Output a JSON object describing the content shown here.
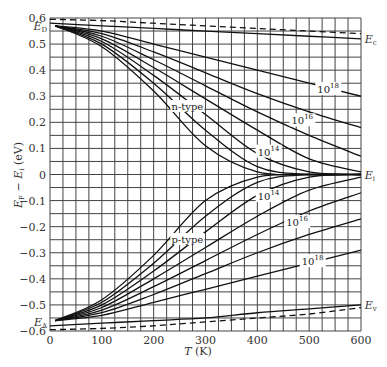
{
  "chart_data": {
    "type": "line",
    "title": "",
    "xlabel": "T (K)",
    "ylabel": "E_F − E_i (eV)",
    "xlim": [
      0,
      600
    ],
    "ylim": [
      -0.6,
      0.6
    ],
    "xticks": [
      0,
      100,
      200,
      300,
      400,
      500,
      600
    ],
    "yticks": [
      0.6,
      0.5,
      0.4,
      0.3,
      0.2,
      0.1,
      0,
      -0.1,
      -0.2,
      -0.3,
      -0.4,
      -0.5,
      -0.6
    ],
    "ytick_labels": [
      "0.6",
      "0.5",
      "0.4",
      "0.3",
      "0.2",
      "0.1",
      "0",
      "−0.1",
      "−0.2",
      "−0.3",
      "−0.4",
      "−0.5",
      "−0.6"
    ],
    "grid": true,
    "grid_x_step": 25,
    "grid_y_step": 0.05,
    "x": [
      0,
      100,
      200,
      300,
      400,
      500,
      600
    ],
    "series": [
      {
        "name": "n-type 10^18",
        "group": "n",
        "values": [
          0.57,
          0.55,
          0.5,
          0.45,
          0.4,
          0.35,
          0.3
        ]
      },
      {
        "name": "n-type 10^17",
        "group": "n",
        "values": [
          0.57,
          0.54,
          0.47,
          0.39,
          0.31,
          0.24,
          0.18
        ]
      },
      {
        "name": "n-type 10^16",
        "group": "n",
        "values": [
          0.57,
          0.53,
          0.44,
          0.34,
          0.24,
          0.15,
          0.07
        ]
      },
      {
        "name": "n-type 10^15",
        "group": "n",
        "values": [
          0.57,
          0.52,
          0.41,
          0.29,
          0.17,
          0.06,
          0.01
        ]
      },
      {
        "name": "n-type 10^14",
        "group": "n",
        "values": [
          0.57,
          0.51,
          0.38,
          0.23,
          0.08,
          0.01,
          0.0
        ]
      },
      {
        "name": "n-type 10^13",
        "group": "n",
        "values": [
          0.57,
          0.5,
          0.35,
          0.17,
          0.03,
          0.0,
          0.0
        ]
      },
      {
        "name": "n-type 10^12",
        "group": "n",
        "values": [
          0.57,
          0.49,
          0.32,
          0.11,
          0.01,
          0.0,
          0.0
        ]
      },
      {
        "name": "p-type 10^18",
        "group": "p",
        "values": [
          -0.56,
          -0.54,
          -0.49,
          -0.44,
          -0.39,
          -0.34,
          -0.29
        ]
      },
      {
        "name": "p-type 10^17",
        "group": "p",
        "values": [
          -0.56,
          -0.53,
          -0.46,
          -0.38,
          -0.3,
          -0.23,
          -0.17
        ]
      },
      {
        "name": "p-type 10^16",
        "group": "p",
        "values": [
          -0.56,
          -0.52,
          -0.43,
          -0.33,
          -0.23,
          -0.14,
          -0.07
        ]
      },
      {
        "name": "p-type 10^15",
        "group": "p",
        "values": [
          -0.56,
          -0.51,
          -0.4,
          -0.28,
          -0.16,
          -0.06,
          -0.01
        ]
      },
      {
        "name": "p-type 10^14",
        "group": "p",
        "values": [
          -0.56,
          -0.5,
          -0.37,
          -0.22,
          -0.08,
          -0.01,
          0.0
        ]
      },
      {
        "name": "p-type 10^13",
        "group": "p",
        "values": [
          -0.56,
          -0.49,
          -0.34,
          -0.16,
          -0.03,
          0.0,
          0.0
        ]
      },
      {
        "name": "p-type 10^12",
        "group": "p",
        "values": [
          -0.56,
          -0.48,
          -0.31,
          -0.1,
          -0.01,
          0.0,
          0.0
        ]
      },
      {
        "name": "E_c",
        "style": "solid",
        "values": [
          0.58,
          0.57,
          0.56,
          0.55,
          0.54,
          0.53,
          0.52
        ]
      },
      {
        "name": "E_c (dashed)",
        "style": "dashed",
        "values": [
          0.595,
          0.59,
          0.58,
          0.57,
          0.56,
          0.55,
          0.54
        ]
      },
      {
        "name": "E_v",
        "style": "solid",
        "values": [
          -0.58,
          -0.57,
          -0.56,
          -0.55,
          -0.53,
          -0.515,
          -0.5
        ]
      },
      {
        "name": "E_v (dashed)",
        "style": "dashed",
        "values": [
          -0.595,
          -0.59,
          -0.58,
          -0.565,
          -0.55,
          -0.535,
          -0.51
        ]
      }
    ],
    "annotations": [
      {
        "text": "E_D",
        "x": -25,
        "y": 0.57
      },
      {
        "text": "E_A",
        "x": -25,
        "y": -0.565
      },
      {
        "text": "E_c",
        "x": 615,
        "y": 0.52
      },
      {
        "text": "E_i",
        "x": 615,
        "y": 0.0
      },
      {
        "text": "E_v",
        "x": 615,
        "y": -0.5
      },
      {
        "text": "n-type",
        "x": 265,
        "y": 0.255
      },
      {
        "text": "p-type",
        "x": 265,
        "y": -0.255
      },
      {
        "text": "10^18",
        "x": 535,
        "y": 0.32
      },
      {
        "text": "10^16",
        "x": 485,
        "y": 0.2
      },
      {
        "text": "10^14",
        "x": 420,
        "y": 0.08
      },
      {
        "text": "10^14",
        "x": 420,
        "y": -0.09
      },
      {
        "text": "10^16",
        "x": 475,
        "y": -0.19
      },
      {
        "text": "10^18",
        "x": 505,
        "y": -0.34
      }
    ]
  },
  "labels": {
    "xlabel_T": "T",
    "xlabel_unit": "(K)",
    "ylabel": "E",
    "n_type": "n-type",
    "p_type": "p-type"
  }
}
